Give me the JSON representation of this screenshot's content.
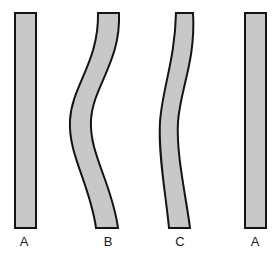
{
  "figure": {
    "background_color": "#ffffff",
    "fill_color": "#c8c8c8",
    "stroke_color": "#141414",
    "stroke_width": 2,
    "label_color": "#1a1a1a",
    "shapes": [
      {
        "id": "shape-a-left",
        "label": "A",
        "kind": "straight-bar",
        "label_x": 24,
        "label_y": 246,
        "path": "M 15 13 L 36 13 L 36 228 L 15 228 Z"
      },
      {
        "id": "shape-b",
        "label": "B",
        "kind": "s-curve-band",
        "label_x": 108,
        "label_y": 246,
        "path": "M 98 13 L 119 13 C 121 62 93 86 91 120 C 89 154 112 183 118 228 L 96 228 C 90 184 68 155 70 120 C 72 85 99 62 98 13 Z"
      },
      {
        "id": "shape-c",
        "label": "C",
        "kind": "gentle-s-curve-band",
        "label_x": 180,
        "label_y": 246,
        "path": "M 176 13 L 193 13 C 196 60 180 90 178 122 C 176 154 186 196 190 228 L 169 228 C 166 196 158 154 160 122 C 162 90 175 60 176 13 Z"
      },
      {
        "id": "shape-a-right",
        "label": "A",
        "kind": "straight-bar",
        "label_x": 255,
        "label_y": 246,
        "path": "M 245 13 L 266 13 L 266 228 L 245 228 Z"
      }
    ]
  }
}
